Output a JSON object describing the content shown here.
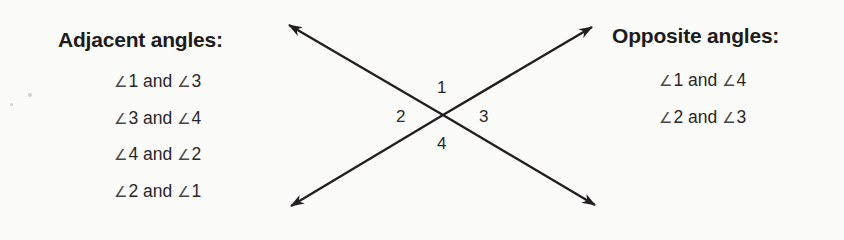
{
  "adjacent": {
    "heading": "Adjacent angles:",
    "pairs": [
      {
        "a": "1",
        "conj": "and",
        "b": "3"
      },
      {
        "a": "3",
        "conj": "and",
        "b": "4"
      },
      {
        "a": "4",
        "conj": "and",
        "b": "2"
      },
      {
        "a": "2",
        "conj": "and",
        "b": "1"
      }
    ]
  },
  "opposite": {
    "heading": "Opposite angles:",
    "pairs": [
      {
        "a": "1",
        "conj": "and",
        "b": "4"
      },
      {
        "a": "2",
        "conj": "and",
        "b": "3"
      }
    ]
  },
  "angle_symbol": "∠",
  "intersection": {
    "labels": {
      "top": "1",
      "left": "2",
      "right": "3",
      "bottom": "4"
    },
    "line_color": "#231f20"
  }
}
